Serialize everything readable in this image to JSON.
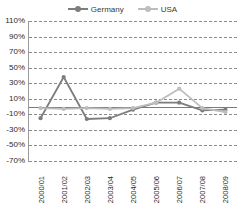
{
  "chart_data": {
    "type": "line",
    "title": "",
    "subtitle": "",
    "xlabel": "",
    "ylabel": "",
    "grid": true,
    "legend_position": "top-center",
    "categories": [
      "2000/01",
      "2001/02",
      "2002/03",
      "2003/04",
      "2004/05",
      "2005/06",
      "2006/07",
      "2007/08",
      "2008/09"
    ],
    "ytick_labels": [
      "110%",
      "90%",
      "70%",
      "50%",
      "30%",
      "10%",
      "-10%",
      "-30%",
      "-50%",
      "-70%"
    ],
    "ytick_values": [
      110,
      90,
      70,
      50,
      30,
      10,
      -10,
      -30,
      -50,
      -70
    ],
    "ylim": [
      -70,
      110
    ],
    "series": [
      {
        "name": "Germany",
        "color": "#7d7d7d",
        "marker": "circle",
        "values": [
          -15,
          38,
          -16,
          -15,
          -4,
          5,
          5,
          -5,
          -4
        ]
      },
      {
        "name": "USA",
        "color": "#bdbdbd",
        "marker": "circle",
        "values": [
          -2,
          -3,
          -2,
          -3,
          -2,
          5,
          23,
          -2,
          -7
        ]
      }
    ]
  },
  "legend": {
    "entries": [
      {
        "label": "Germany"
      },
      {
        "label": "USA"
      }
    ]
  },
  "colors": {
    "germany": "#7d7d7d",
    "usa": "#bdbdbd",
    "grid": "#8c8c8c",
    "axis": "#9a9a9a",
    "text": "#2b2b2b",
    "background": "#ffffff"
  }
}
